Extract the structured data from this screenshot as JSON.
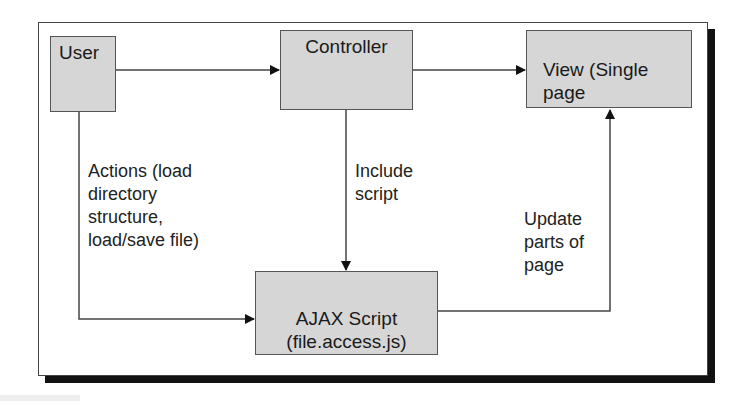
{
  "nodes": {
    "user": {
      "label": "User"
    },
    "controller": {
      "label": "Controller"
    },
    "view": {
      "label": "View (Single\npage"
    },
    "ajax": {
      "label": "AJAX Script\n(file.access.js)"
    }
  },
  "edges": {
    "user_to_ajax": {
      "label": "Actions (load\ndirectory\nstructure,\nload/save file)"
    },
    "controller_to_ajax": {
      "label": "Include\nscript"
    },
    "ajax_to_view": {
      "label": "Update\nparts of\npage"
    }
  },
  "colors": {
    "node_fill": "#d6d6d6",
    "stroke": "#444444",
    "shadow": "#111111"
  }
}
